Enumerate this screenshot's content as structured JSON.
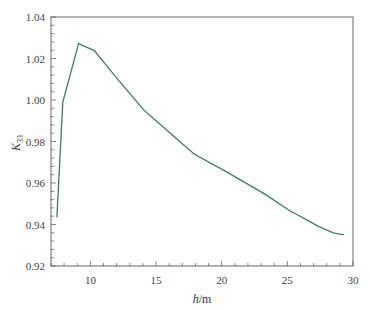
{
  "chart_data": {
    "type": "line",
    "title": "",
    "xlabel": "h/m",
    "xlabel_italic": "h",
    "xlabel_unit": "/m",
    "ylabel": "K33",
    "ylabel_main": "K",
    "ylabel_sub": "33",
    "xlim": [
      7,
      30
    ],
    "ylim": [
      0.92,
      1.04
    ],
    "xticks": [
      10,
      15,
      20,
      25,
      30
    ],
    "xtick_labels": [
      "10",
      "15",
      "20",
      "25",
      "30"
    ],
    "yticks": [
      0.92,
      0.94,
      0.96,
      0.98,
      1.0,
      1.02,
      1.04
    ],
    "ytick_labels": [
      "0.92",
      "0.94",
      "0.96",
      "0.98",
      "1.00",
      "1.02",
      "1.04"
    ],
    "grid": false,
    "legend": null,
    "line_color": "#3d7a6a",
    "series": [
      {
        "name": "K33",
        "x": [
          7.45,
          7.9,
          9.1,
          10.3,
          12.0,
          14.1,
          16.0,
          17.9,
          20.2,
          23.2,
          25.1,
          27.4,
          28.5,
          29.3
        ],
        "y": [
          0.9435,
          0.999,
          1.0272,
          1.0238,
          1.0105,
          0.995,
          0.9845,
          0.974,
          0.966,
          0.955,
          0.947,
          0.939,
          0.936,
          0.935
        ]
      }
    ]
  }
}
